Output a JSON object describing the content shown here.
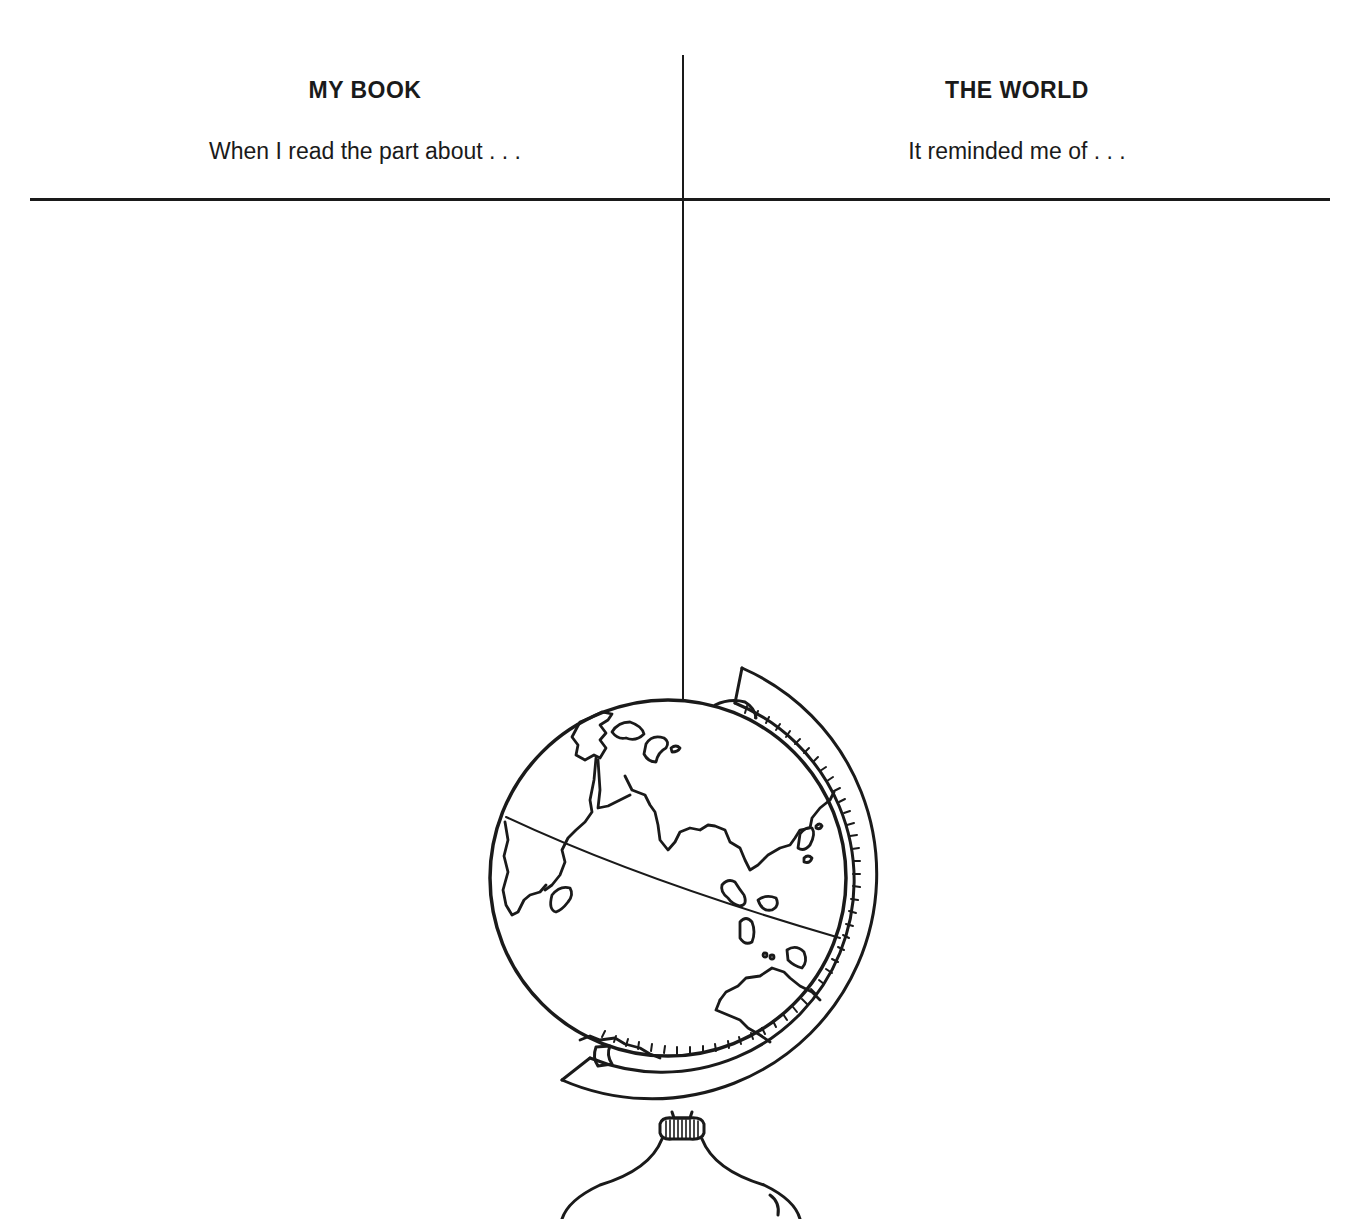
{
  "worksheet": {
    "columns": [
      {
        "title": "MY BOOK",
        "prompt": "When I read the part about . . ."
      },
      {
        "title": "THE WORLD",
        "prompt": "It reminded me of . . ."
      }
    ],
    "illustration": {
      "name": "desk globe",
      "icon": "globe-icon"
    },
    "colors": {
      "ink": "#1a1a1a",
      "paper": "#ffffff"
    }
  }
}
